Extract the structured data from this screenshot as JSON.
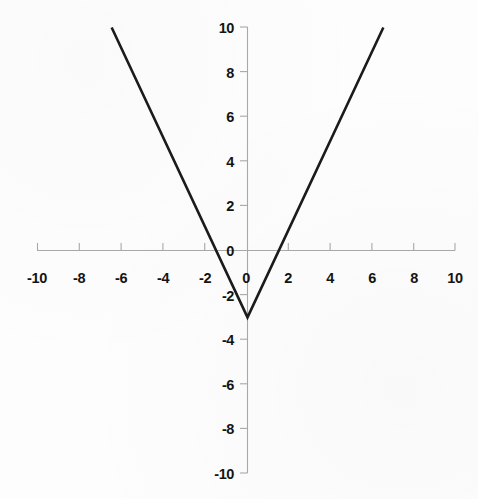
{
  "chart_data": {
    "type": "line",
    "title": "",
    "subtitle": "",
    "xlabel": "",
    "ylabel": "",
    "xlim": [
      -10,
      10
    ],
    "ylim": [
      -10,
      10
    ],
    "grid": false,
    "legend": null,
    "equation": "y = 2|x| - 3",
    "vertex": {
      "x": 0,
      "y": -3
    },
    "x_intercepts": [
      -1.5,
      1.5
    ],
    "y_intercept": -3,
    "x_ticks": [
      -10,
      -8,
      -6,
      -4,
      -2,
      0,
      2,
      4,
      6,
      8,
      10
    ],
    "y_ticks": [
      10,
      8,
      6,
      4,
      2,
      0,
      -2,
      -4,
      -6,
      -8,
      -10
    ],
    "x_tick_labels": [
      "-10",
      "-8",
      "-6",
      "-4",
      "-2",
      "0",
      "2",
      "4",
      "6",
      "8",
      "10"
    ],
    "y_tick_labels": [
      "10",
      "8",
      "6",
      "4",
      "2",
      "0",
      "-2",
      "-4",
      "-6",
      "-8",
      "-10"
    ],
    "series": [
      {
        "name": "y = 2|x| - 3",
        "color": "#1b1b1b",
        "points": [
          {
            "x": -6.5,
            "y": 10
          },
          {
            "x": 0,
            "y": -3
          },
          {
            "x": 6.5,
            "y": 10
          }
        ]
      }
    ],
    "axis_color": "#a9a9a9",
    "line_color": "#1b1b1b",
    "background_color": "#fdfdfd"
  },
  "axis": {
    "x_label_0": "-10",
    "x_label_1": "-8",
    "x_label_2": "-6",
    "x_label_3": "-4",
    "x_label_4": "-2",
    "x_label_5": "0",
    "x_label_6": "2",
    "x_label_7": "4",
    "x_label_8": "6",
    "x_label_9": "8",
    "x_label_10": "10",
    "y_label_0": "10",
    "y_label_1": "8",
    "y_label_2": "6",
    "y_label_3": "4",
    "y_label_4": "2",
    "y_label_5": "0",
    "y_label_6": "-2",
    "y_label_7": "-4",
    "y_label_8": "-6",
    "y_label_9": "-8",
    "y_label_10": "-10"
  }
}
